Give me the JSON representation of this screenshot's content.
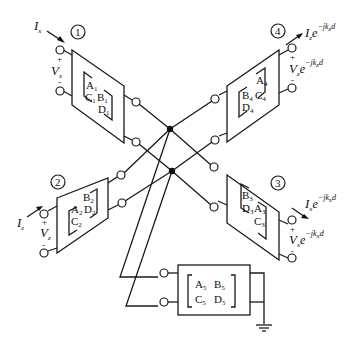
{
  "diagram": {
    "ports": [
      {
        "number": "1",
        "current": "I",
        "current_sub": "x",
        "voltage": "V",
        "voltage_sub": "x",
        "plus": "+",
        "minus": "-"
      },
      {
        "number": "2",
        "current": "I",
        "current_sub": "z",
        "voltage": "V",
        "voltage_sub": "z",
        "plus": "+",
        "minus": "-"
      },
      {
        "number": "3",
        "current": "I",
        "current_sub": "x",
        "current_exp": "−jk",
        "current_exp_sub": "x",
        "current_exp_tail": "d",
        "voltage": "V",
        "voltage_sub": "x",
        "voltage_exp": "−jk",
        "voltage_exp_sub": "x",
        "voltage_exp_tail": "d",
        "e": "e",
        "plus": "+",
        "minus": "-"
      },
      {
        "number": "4",
        "current": "I",
        "current_sub": "z",
        "current_exp": "−jk",
        "current_exp_sub": "z",
        "current_exp_tail": "d",
        "voltage": "V",
        "voltage_sub": "z",
        "voltage_exp": "−jk",
        "voltage_exp_sub": "z",
        "voltage_exp_tail": "d",
        "e": "e",
        "plus": "+",
        "minus": "-"
      }
    ],
    "networks": [
      {
        "id": "1",
        "A": "A",
        "B": "B",
        "C": "C",
        "D": "D",
        "sub": "1"
      },
      {
        "id": "2",
        "A": "A",
        "B": "B",
        "C": "C",
        "D": "D",
        "sub": "2"
      },
      {
        "id": "3",
        "A": "A",
        "B": "B",
        "C": "C",
        "D": "D",
        "sub": "3"
      },
      {
        "id": "4",
        "A": "A",
        "B": "B",
        "C": "C",
        "D": "D",
        "sub": "4"
      },
      {
        "id": "5",
        "A": "A",
        "B": "B",
        "C": "C",
        "D": "D",
        "sub": "5"
      }
    ],
    "ground_symbol": "ground-icon"
  }
}
